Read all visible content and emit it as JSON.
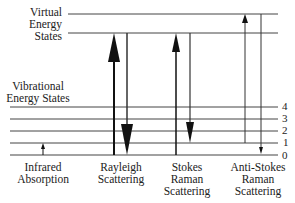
{
  "labels": {
    "virtual_states": [
      "Virtual",
      "Energy",
      "States"
    ],
    "vibrational_states": [
      "Vibrational",
      "Energy States"
    ],
    "processes": [
      {
        "name": "infrared",
        "lines": [
          "Infrared",
          "Absorption"
        ]
      },
      {
        "name": "rayleigh",
        "lines": [
          "Rayleigh",
          "Scattering"
        ]
      },
      {
        "name": "stokes",
        "lines": [
          "Stokes",
          "Raman",
          "Scattering"
        ]
      },
      {
        "name": "anti-stokes",
        "lines": [
          "Anti-Stokes",
          "Raman",
          "Scattering"
        ]
      }
    ]
  },
  "levels": {
    "vibrational": [
      "0",
      "1",
      "2",
      "3",
      "4"
    ]
  },
  "colors": {
    "line": "#333333",
    "arrow": "#111111"
  }
}
